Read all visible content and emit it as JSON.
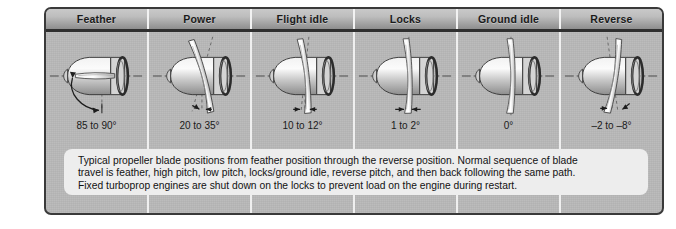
{
  "figure": {
    "type": "technical-illustration"
  },
  "columns": [
    {
      "header": "Feather",
      "angle": "85 to 90°",
      "blade_tilt_deg": 88,
      "marker": "curved-arrow"
    },
    {
      "header": "Power",
      "angle": "20 to 35°",
      "blade_tilt_deg": 27,
      "marker": "double-arrow"
    },
    {
      "header": "Flight idle",
      "angle": "10 to 12°",
      "blade_tilt_deg": 11,
      "marker": "double-arrow"
    },
    {
      "header": "Locks",
      "angle": "1 to 2°",
      "blade_tilt_deg": 2,
      "marker": "double-arrow"
    },
    {
      "header": "Ground idle",
      "angle": "0°",
      "blade_tilt_deg": 0,
      "marker": "centerline"
    },
    {
      "header": "Reverse",
      "angle": "–2 to –8°",
      "blade_tilt_deg": -6,
      "marker": "double-arrow"
    }
  ],
  "caption": {
    "line1": "Typical propeller blade positions from feather position through the reverse position. Normal sequence of blade",
    "line2": "travel is feather, high pitch, low pitch, locks/ground idle, reverse pitch, and then back following the same path.",
    "line3": "Fixed turboprop engines are shut down on the locks to prevent load on the engine during restart."
  },
  "colors": {
    "plate_background": "#b9b9b9",
    "plate_border": "#3a3a3a",
    "header_dark": "#8e8e8e",
    "header_light": "#c9c9c9",
    "caption_background": "#ededed",
    "ink": "#1a1a1a"
  }
}
